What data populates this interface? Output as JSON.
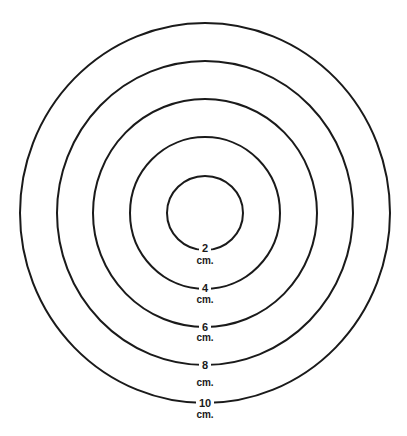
{
  "diagram": {
    "title": "",
    "center": {
      "x": 205,
      "y": 213
    },
    "stroke_color": "#1a1a1a",
    "background": "#ffffff",
    "rings": [
      {
        "value": "2",
        "unit": "cm.",
        "rx": 38,
        "ry": 37,
        "num_y": 252,
        "unit_y": 264
      },
      {
        "value": "4",
        "unit": "cm.",
        "rx": 75,
        "ry": 76,
        "num_y": 292,
        "unit_y": 303
      },
      {
        "value": "6",
        "unit": "cm.",
        "rx": 112,
        "ry": 114,
        "num_y": 331,
        "unit_y": 341
      },
      {
        "value": "8",
        "unit": "cm.",
        "rx": 148,
        "ry": 152,
        "num_y": 369,
        "unit_y": 386
      },
      {
        "value": "10",
        "unit": "cm.",
        "rx": 185,
        "ry": 190,
        "num_y": 407,
        "unit_y": 418
      }
    ]
  }
}
